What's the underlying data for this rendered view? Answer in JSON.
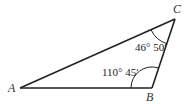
{
  "diagram": {
    "type": "triangle",
    "vertices": {
      "A": {
        "label": "A"
      },
      "B": {
        "label": "B"
      },
      "C": {
        "label": "C"
      }
    },
    "angles": {
      "B": {
        "label": "110° 45′"
      },
      "C": {
        "label": "46° 50′"
      }
    },
    "colors": {
      "stroke": "#222222",
      "background": "#ffffff"
    }
  }
}
